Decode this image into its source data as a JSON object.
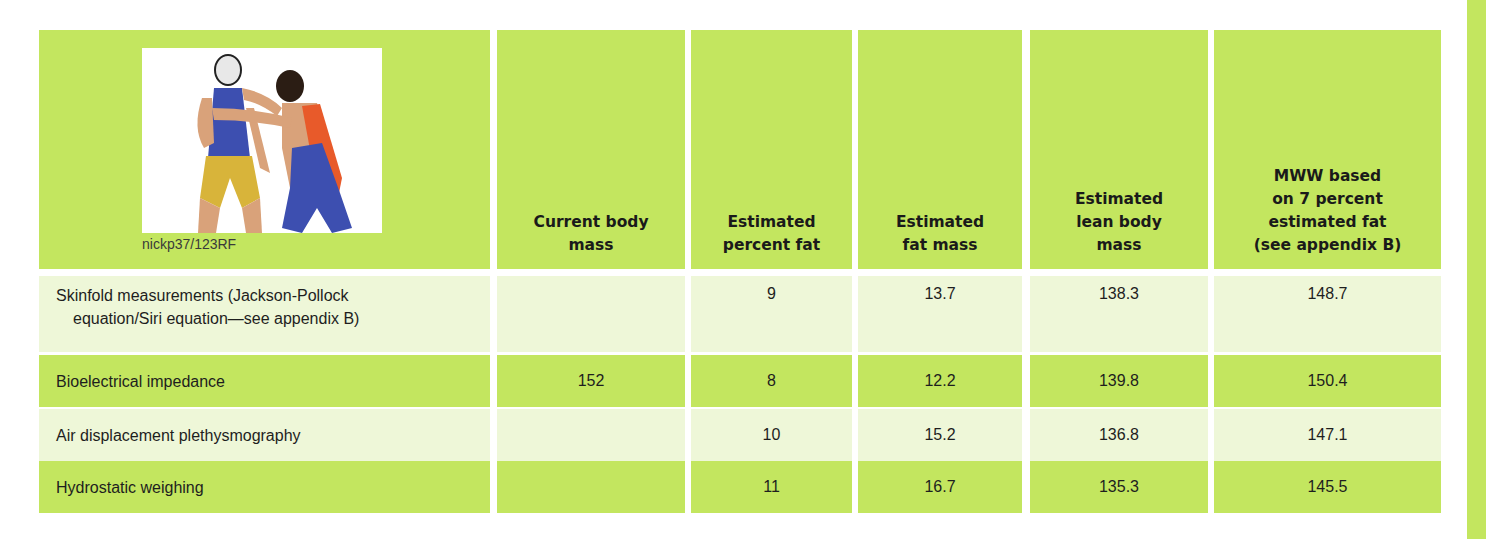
{
  "table": {
    "photo_credit": "nickp37/123RF",
    "photo_description": "Two wrestlers grappling; one in blue singlet with yellow shorts and white headgear, one in blue and orange singlet",
    "headers": [
      "",
      "Current body mass",
      "Estimated percent fat",
      "Estimated fat mass",
      "Estimated lean body mass",
      "MWW based on 7 percent estimated fat (see appendix B)"
    ],
    "header_lines": {
      "col1": [
        "Current body",
        "mass"
      ],
      "col2": [
        "Estimated",
        "percent fat"
      ],
      "col3": [
        "Estimated",
        "fat mass"
      ],
      "col4": [
        "Estimated",
        "lean body",
        "mass"
      ],
      "col5": [
        "MWW based",
        "on 7  percent",
        "estimated fat",
        "(see  appendix B)"
      ]
    },
    "rows": [
      {
        "method": "Skinfold measurements (Jackson-Pollock equation/Siri equation—see appendix B)",
        "method_lines": [
          "Skinfold measurements (Jackson-Pollock",
          "equation/Siri equation—see appendix B)"
        ],
        "current_body_mass": "",
        "percent_fat": "9",
        "fat_mass": "13.7",
        "lean_body_mass": "138.3",
        "mww": "148.7"
      },
      {
        "method": "Bioelectrical impedance",
        "current_body_mass": "152",
        "percent_fat": "8",
        "fat_mass": "12.2",
        "lean_body_mass": "139.8",
        "mww": "150.4"
      },
      {
        "method": "Air displacement plethysmography",
        "current_body_mass": "",
        "percent_fat": "10",
        "fat_mass": "15.2",
        "lean_body_mass": "136.8",
        "mww": "147.1"
      },
      {
        "method": "Hydrostatic weighing",
        "current_body_mass": "",
        "percent_fat": "11",
        "fat_mass": "16.7",
        "lean_body_mass": "135.3",
        "mww": "145.5"
      }
    ]
  },
  "colors": {
    "header_green": "#c3e65f",
    "row_dark_green": "#c3e65f",
    "row_light_green": "#eef7d8",
    "text": "#1e1e1e"
  }
}
